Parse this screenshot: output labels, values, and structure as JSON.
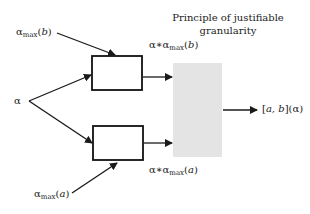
{
  "diagram": {
    "title_line1": "Principle of justifiable",
    "title_line2": "granularity",
    "input_alpha": "α",
    "top_input": {
      "symbol": "α",
      "sub": "max",
      "arg": "b"
    },
    "bottom_input": {
      "symbol": "α",
      "sub": "max",
      "arg": "a"
    },
    "top_output": {
      "prefix": "α∗α",
      "sub": "max",
      "arg": "b"
    },
    "bottom_output": {
      "prefix": "α∗α",
      "sub": "max",
      "arg": "a"
    },
    "result": {
      "interval": "a, b",
      "arg": "α"
    },
    "colors": {
      "line": "#1a1a1a",
      "gray_box": "#e6e6e6",
      "box_border": "#111111"
    }
  }
}
